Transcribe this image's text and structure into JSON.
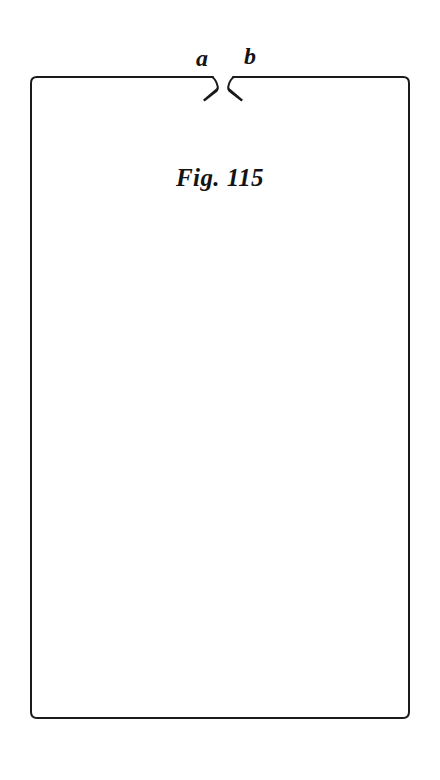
{
  "figure": {
    "caption": "Fig. 115",
    "background_color": "#ffffff",
    "ink_color": "#1a1a1a",
    "labels": [
      {
        "id": "a",
        "text": "a",
        "x": 204,
        "y": 62
      },
      {
        "id": "b",
        "text": "b",
        "x": 252,
        "y": 60
      }
    ],
    "sheet": {
      "name": "notched-rectangle",
      "left": 31,
      "top": 77,
      "right": 409,
      "bottom": 718,
      "corner_radius": 6,
      "stroke_width": 2
    },
    "notch": {
      "name": "v-notch",
      "gap_left_x": 213,
      "gap_right_x": 233,
      "apex_y": 88,
      "tip_y": 101,
      "left_tip_x": 204,
      "right_tip_x": 243
    }
  }
}
